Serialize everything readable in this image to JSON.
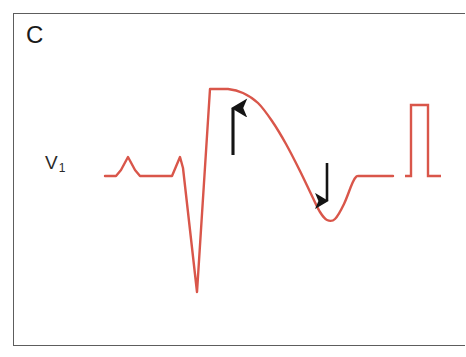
{
  "figure": {
    "panel_label": "C",
    "lead_label_base": "V",
    "lead_label_subscript": "1",
    "background_color": "#ffffff",
    "frame_color": "#5d5d5d",
    "trace_color": "#d9564a",
    "arrow_color": "#141414"
  },
  "annotations": {
    "up_arrow_name": "st-elevation-up-arrow",
    "down_arrow_name": "t-wave-inversion-down-arrow"
  },
  "chart_data": {
    "type": "line",
    "title": "C",
    "subtitle": "",
    "xlabel": "",
    "ylabel": "V 1",
    "grid": false,
    "legend": "none",
    "axis_visible": false,
    "xlim": [
      95,
      445
    ],
    "ylim": [
      85,
      300
    ],
    "series": [
      {
        "name": "V1 ECG tracing",
        "color": "#d9564a",
        "points": [
          [
            105,
            176
          ],
          [
            116,
            176
          ],
          [
            121,
            170
          ],
          [
            128,
            157
          ],
          [
            135,
            170
          ],
          [
            140,
            176
          ],
          [
            172,
            176
          ],
          [
            180,
            157
          ],
          [
            183,
            168
          ],
          [
            197,
            292
          ],
          [
            210,
            89
          ],
          [
            228,
            89
          ],
          [
            243,
            93
          ],
          [
            258,
            103
          ],
          [
            272,
            121
          ],
          [
            286,
            144
          ],
          [
            300,
            171
          ],
          [
            312,
            196
          ],
          [
            320,
            212
          ],
          [
            327,
            220
          ],
          [
            335,
            219
          ],
          [
            344,
            204
          ],
          [
            352,
            184
          ],
          [
            356,
            177
          ],
          [
            362,
            176
          ],
          [
            393,
            176
          ]
        ]
      },
      {
        "name": "calibration pulse",
        "color": "#d9564a",
        "points": [
          [
            405,
            176
          ],
          [
            411,
            176
          ],
          [
            411,
            105
          ],
          [
            428,
            105
          ],
          [
            428,
            176
          ],
          [
            441,
            176
          ]
        ]
      }
    ],
    "annotations": [
      {
        "label": "up-arrow",
        "kind": "arrow",
        "direction": "up",
        "x": 233,
        "y_tail": 155,
        "y_head": 108,
        "meaning": "ST segment elevation"
      },
      {
        "label": "down-arrow",
        "kind": "arrow",
        "direction": "down",
        "x": 327,
        "y_tail": 163,
        "y_head": 201,
        "meaning": "inverted T wave"
      }
    ],
    "features": [
      {
        "name": "baseline",
        "y": 176
      },
      {
        "name": "p-wave-peak",
        "x": 128,
        "y": 157
      },
      {
        "name": "r-wave-peak",
        "x": 180,
        "y": 157
      },
      {
        "name": "s-wave-nadir",
        "x": 197,
        "y": 292
      },
      {
        "name": "st-plateau-top",
        "x_start": 210,
        "x_end": 228,
        "y": 89
      },
      {
        "name": "t-wave-trough",
        "x": 327,
        "y": 220
      },
      {
        "name": "calibration-pulse-top",
        "y": 105
      }
    ]
  }
}
